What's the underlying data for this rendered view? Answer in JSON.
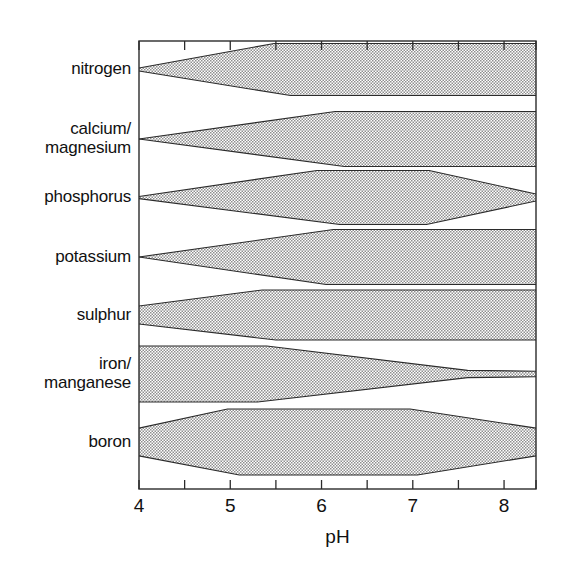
{
  "chart_data": {
    "type": "area",
    "title": "",
    "xlabel": "pH",
    "ylabel": "",
    "xlim": [
      4,
      8.35
    ],
    "grid": false,
    "legend": "none",
    "xticks_major": [
      4,
      5,
      6,
      7,
      8
    ],
    "xticks_minor": [
      4.5,
      5.5,
      6.5,
      7.5
    ],
    "xtick_labels": [
      "4",
      "5",
      "6",
      "7",
      "8"
    ],
    "categories": [
      "nitrogen",
      "calcium/\nmagnesium",
      "phosphorus",
      "potassium",
      "sulphur",
      "iron/\nmanganese",
      "boron"
    ],
    "series": [
      {
        "name": "nitrogen",
        "label_lines": [
          "nitrogen"
        ],
        "band_top": [
          [
            4.0,
            0.06
          ],
          [
            5.48,
            1.0
          ],
          [
            8.35,
            1.0
          ]
        ],
        "band_bottom": [
          [
            4.0,
            -0.06
          ],
          [
            5.66,
            -1.0
          ],
          [
            8.35,
            -1.0
          ]
        ]
      },
      {
        "name": "calcium/magnesium",
        "label_lines": [
          "calcium/",
          "magnesium"
        ],
        "band_top": [
          [
            4.0,
            0.0
          ],
          [
            6.15,
            1.0
          ],
          [
            8.35,
            1.0
          ]
        ],
        "band_bottom": [
          [
            4.0,
            0.0
          ],
          [
            6.25,
            -1.0
          ],
          [
            8.35,
            -1.0
          ]
        ]
      },
      {
        "name": "phosphorus",
        "label_lines": [
          "phosphorus"
        ],
        "band_top": [
          [
            4.0,
            0.04
          ],
          [
            5.95,
            1.0
          ],
          [
            7.18,
            1.0
          ],
          [
            8.35,
            0.13
          ]
        ],
        "band_bottom": [
          [
            4.0,
            -0.04
          ],
          [
            6.2,
            -1.0
          ],
          [
            7.15,
            -1.0
          ],
          [
            8.35,
            -0.13
          ]
        ]
      },
      {
        "name": "potassium",
        "label_lines": [
          "potassium"
        ],
        "band_top": [
          [
            4.0,
            0.0
          ],
          [
            6.13,
            1.0
          ],
          [
            8.35,
            1.0
          ]
        ],
        "band_bottom": [
          [
            4.0,
            0.0
          ],
          [
            6.05,
            -1.0
          ],
          [
            8.35,
            -1.0
          ]
        ]
      },
      {
        "name": "sulphur",
        "label_lines": [
          "sulphur"
        ],
        "band_top": [
          [
            4.0,
            0.36
          ],
          [
            5.35,
            1.0
          ],
          [
            8.35,
            1.0
          ]
        ],
        "band_bottom": [
          [
            4.0,
            -0.36
          ],
          [
            5.5,
            -1.0
          ],
          [
            8.35,
            -1.0
          ]
        ]
      },
      {
        "name": "iron/manganese",
        "label_lines": [
          "iron/",
          "manganese"
        ],
        "band_top": [
          [
            4.0,
            1.0
          ],
          [
            5.4,
            1.0
          ],
          [
            7.6,
            0.13
          ],
          [
            8.35,
            0.1
          ]
        ],
        "band_bottom": [
          [
            4.0,
            -1.0
          ],
          [
            5.3,
            -1.0
          ],
          [
            7.6,
            -0.13
          ],
          [
            8.35,
            -0.1
          ]
        ]
      },
      {
        "name": "boron",
        "label_lines": [
          "boron"
        ],
        "band_top": [
          [
            4.0,
            0.42
          ],
          [
            4.97,
            1.0
          ],
          [
            6.97,
            1.0
          ],
          [
            8.35,
            0.42
          ]
        ],
        "band_bottom": [
          [
            4.0,
            -0.42
          ],
          [
            5.1,
            -1.0
          ],
          [
            7.05,
            -1.0
          ],
          [
            8.35,
            -0.42
          ]
        ]
      }
    ],
    "colors": {
      "band_fill": "#d9d9d9",
      "band_stroke": "#2b2b2b",
      "axis": "#2b2b2b",
      "text": "#111111",
      "background": "#ffffff"
    }
  },
  "axis": {
    "x_title": "pH"
  }
}
